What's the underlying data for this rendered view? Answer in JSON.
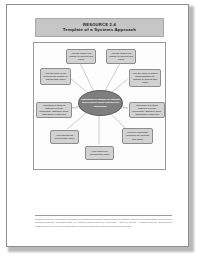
{
  "document": {
    "resource_label": "RESOURCE 2.4",
    "title": "Template of a Systems Approach"
  },
  "diagram": {
    "hub": {
      "text": "Statement of change for student achievement (what changes for students?)"
    },
    "nodes": [
      {
        "id": "top-left",
        "text": "How the school will change to support this vision"
      },
      {
        "id": "top-right",
        "text": "How the district will change to support this vision"
      },
      {
        "id": "left-upper",
        "text": "How the work of the principal will change to support this vision"
      },
      {
        "id": "right-upper",
        "text": "How the work of district administrators will change to support this vision"
      },
      {
        "id": "left-mid",
        "text": "Indicators of student changes (needs) knowledge, attitudes, skills, aspirations, behaviors"
      },
      {
        "id": "right-mid",
        "text": "Indicators of teacher changes (needs) knowledge, attitudes, skills, aspirations, behaviors"
      },
      {
        "id": "bottom-left",
        "text": "How parents will support this vision"
      },
      {
        "id": "bottom-right",
        "text": "How the community members will support this vision"
      },
      {
        "id": "bottom-ctr",
        "text": "How others will support this vision"
      }
    ]
  },
  "footer": {
    "text": "Reprinted from the compilation \"STEPS for Professional Learning Communities for Change: Taking the Learning Back into the Local Decision Systems, Thousand Oaks, CA: Corwin, www.corwin.com. Copyright © 2011 by Corwin. All rights reserved. Reproduction authorized only for the local school site or nonprofit organization that has purchased this book."
  },
  "colors": {
    "page_border": "#8e8e8e",
    "title_band": "#c6c6c6",
    "node_fill": "#d2d2d2",
    "hub_fill": "#7e7e7e",
    "connector": "#9a9a9a"
  }
}
